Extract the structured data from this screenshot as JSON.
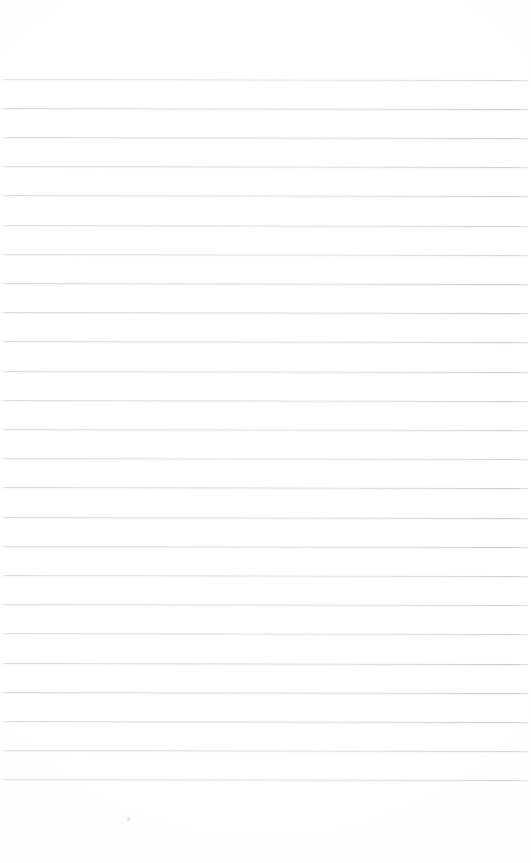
{
  "document": {
    "kind": "scanned-ruled-paper",
    "title": "Blank lined notebook page",
    "page_width": 531,
    "page_height": 863,
    "background_color": "#ffffff",
    "orientation": "portrait",
    "has_text_content": false,
    "visible_text": ""
  },
  "ruling": {
    "line_color": "#d4d4db",
    "line_color_dark": "#c6c6d0",
    "line_thickness_px": 1,
    "line_spacing_px": 29.2,
    "first_line_y": 78.5,
    "last_line_y": 778.5,
    "line_count": 25,
    "line_start_x": 2,
    "line_end_x": 528,
    "slant_degrees": 0.12,
    "top_margin_blank_px": 78,
    "bottom_margin_blank_px": 84,
    "line_y_positions": [
      78.5,
      107.7,
      136.9,
      166.1,
      195.3,
      224.5,
      253.7,
      282.9,
      312.1,
      341.3,
      370.5,
      399.7,
      428.9,
      458.1,
      487.3,
      516.5,
      545.7,
      574.9,
      604.1,
      633.3,
      662.5,
      691.7,
      720.9,
      750.1,
      778.5
    ]
  },
  "artifacts": {
    "line_break": {
      "name": "faded-line-break",
      "on_line_index": 15,
      "x": 262,
      "y": 522,
      "width": 26,
      "height": 3
    },
    "speck": {
      "name": "scan-speck",
      "x": 127,
      "y": 817,
      "width": 3,
      "height": 4,
      "color": "#e2e2e7"
    }
  }
}
